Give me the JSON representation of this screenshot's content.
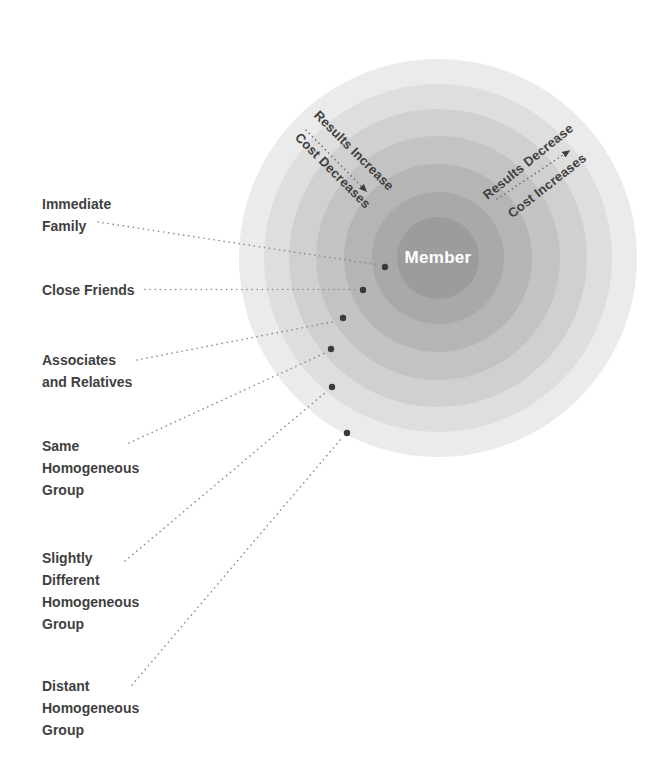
{
  "diagram": {
    "center_label": "Member",
    "ring_labels": [
      {
        "name": "immediate-family",
        "lines": [
          "Immediate",
          "Family"
        ]
      },
      {
        "name": "close-friends",
        "lines": [
          "Close Friends"
        ]
      },
      {
        "name": "associates-and-relatives",
        "lines": [
          "Associates",
          "and Relatives"
        ]
      },
      {
        "name": "same-homogeneous-group",
        "lines": [
          "Same",
          "Homogeneous",
          "Group"
        ]
      },
      {
        "name": "slightly-different-homogeneous-group",
        "lines": [
          "Slightly",
          "Different",
          "Homogeneous",
          "Group"
        ]
      },
      {
        "name": "distant-homogeneous-group",
        "lines": [
          "Distant",
          "Homogeneous",
          "Group"
        ]
      }
    ],
    "gradient_arrows": {
      "toward_center": {
        "line1": "Results Increase",
        "line2": "Cost Decreases"
      },
      "away_from_center": {
        "line1": "Results Decrease",
        "line2": "Cost Increases"
      }
    },
    "colors": {
      "ring_shades_outer_to_inner": [
        "#ebebeb",
        "#dedede",
        "#d0d0d0",
        "#c3c3c3",
        "#b5b5b5",
        "#a9a9a9",
        "#9c9c9c"
      ],
      "label_text": "#3f3f3f",
      "member_text": "#ffffff",
      "marker_dot": "#3a3a3a",
      "leader_line": "#8c8c8c",
      "arrow": "#3f3f3f",
      "background": "#ffffff"
    }
  }
}
